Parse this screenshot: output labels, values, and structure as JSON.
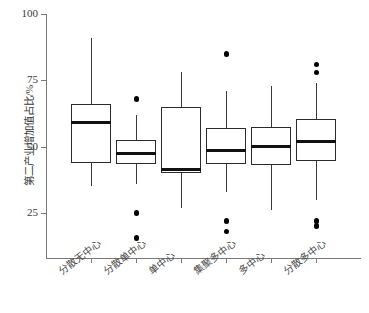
{
  "chart_data": {
    "type": "boxplot",
    "title": "",
    "subtitle": "",
    "xlabel": "",
    "ylabel": "第二产业增加值占比/%",
    "ylim": [
      12,
      100
    ],
    "ytick_values": [
      25,
      50,
      75,
      100
    ],
    "ytick_labels": [
      "25",
      "50",
      "75",
      "100"
    ],
    "grid": false,
    "legend": "none",
    "categories": [
      "分散无中心",
      "分散单中心",
      "单中心",
      "集聚多中心",
      "多中心",
      "分散多中心"
    ],
    "boxes": [
      {
        "category": "分散无中心",
        "whisker_low": 35.0,
        "q1": 44.0,
        "median": 59.0,
        "q3": 66.0,
        "whisker_high": 91.0,
        "outliers": []
      },
      {
        "category": "分散单中心",
        "whisker_low": 36.0,
        "q1": 43.5,
        "median": 47.5,
        "q3": 52.5,
        "whisker_high": 62.0,
        "outliers": [
          68.0,
          25.0,
          15.5
        ]
      },
      {
        "category": "单中心",
        "whisker_low": 27.0,
        "q1": 40.0,
        "median": 41.5,
        "q3": 65.0,
        "whisker_high": 78.0,
        "outliers": []
      },
      {
        "category": "集聚多中心",
        "whisker_low": 33.0,
        "q1": 43.5,
        "median": 48.5,
        "q3": 57.0,
        "whisker_high": 71.0,
        "outliers": [
          85.0,
          22.0,
          18.0
        ]
      },
      {
        "category": "多中心",
        "whisker_low": 26.0,
        "q1": 43.0,
        "median": 50.0,
        "q3": 57.5,
        "whisker_high": 73.0,
        "outliers": []
      },
      {
        "category": "分散多中心",
        "whisker_low": 30.0,
        "q1": 44.5,
        "median": 52.0,
        "q3": 60.5,
        "whisker_high": 74.0,
        "outliers": [
          81.0,
          78.0,
          22.0,
          20.0
        ]
      }
    ],
    "style": {
      "box_fill": "#ffffff",
      "box_stroke": "#2b2b2b",
      "median_color": "#111111",
      "whisker_color": "#3a3a3a",
      "outlier_color": "#000000",
      "axis_color": "#7a7a7a",
      "background": "#ffffff"
    }
  }
}
